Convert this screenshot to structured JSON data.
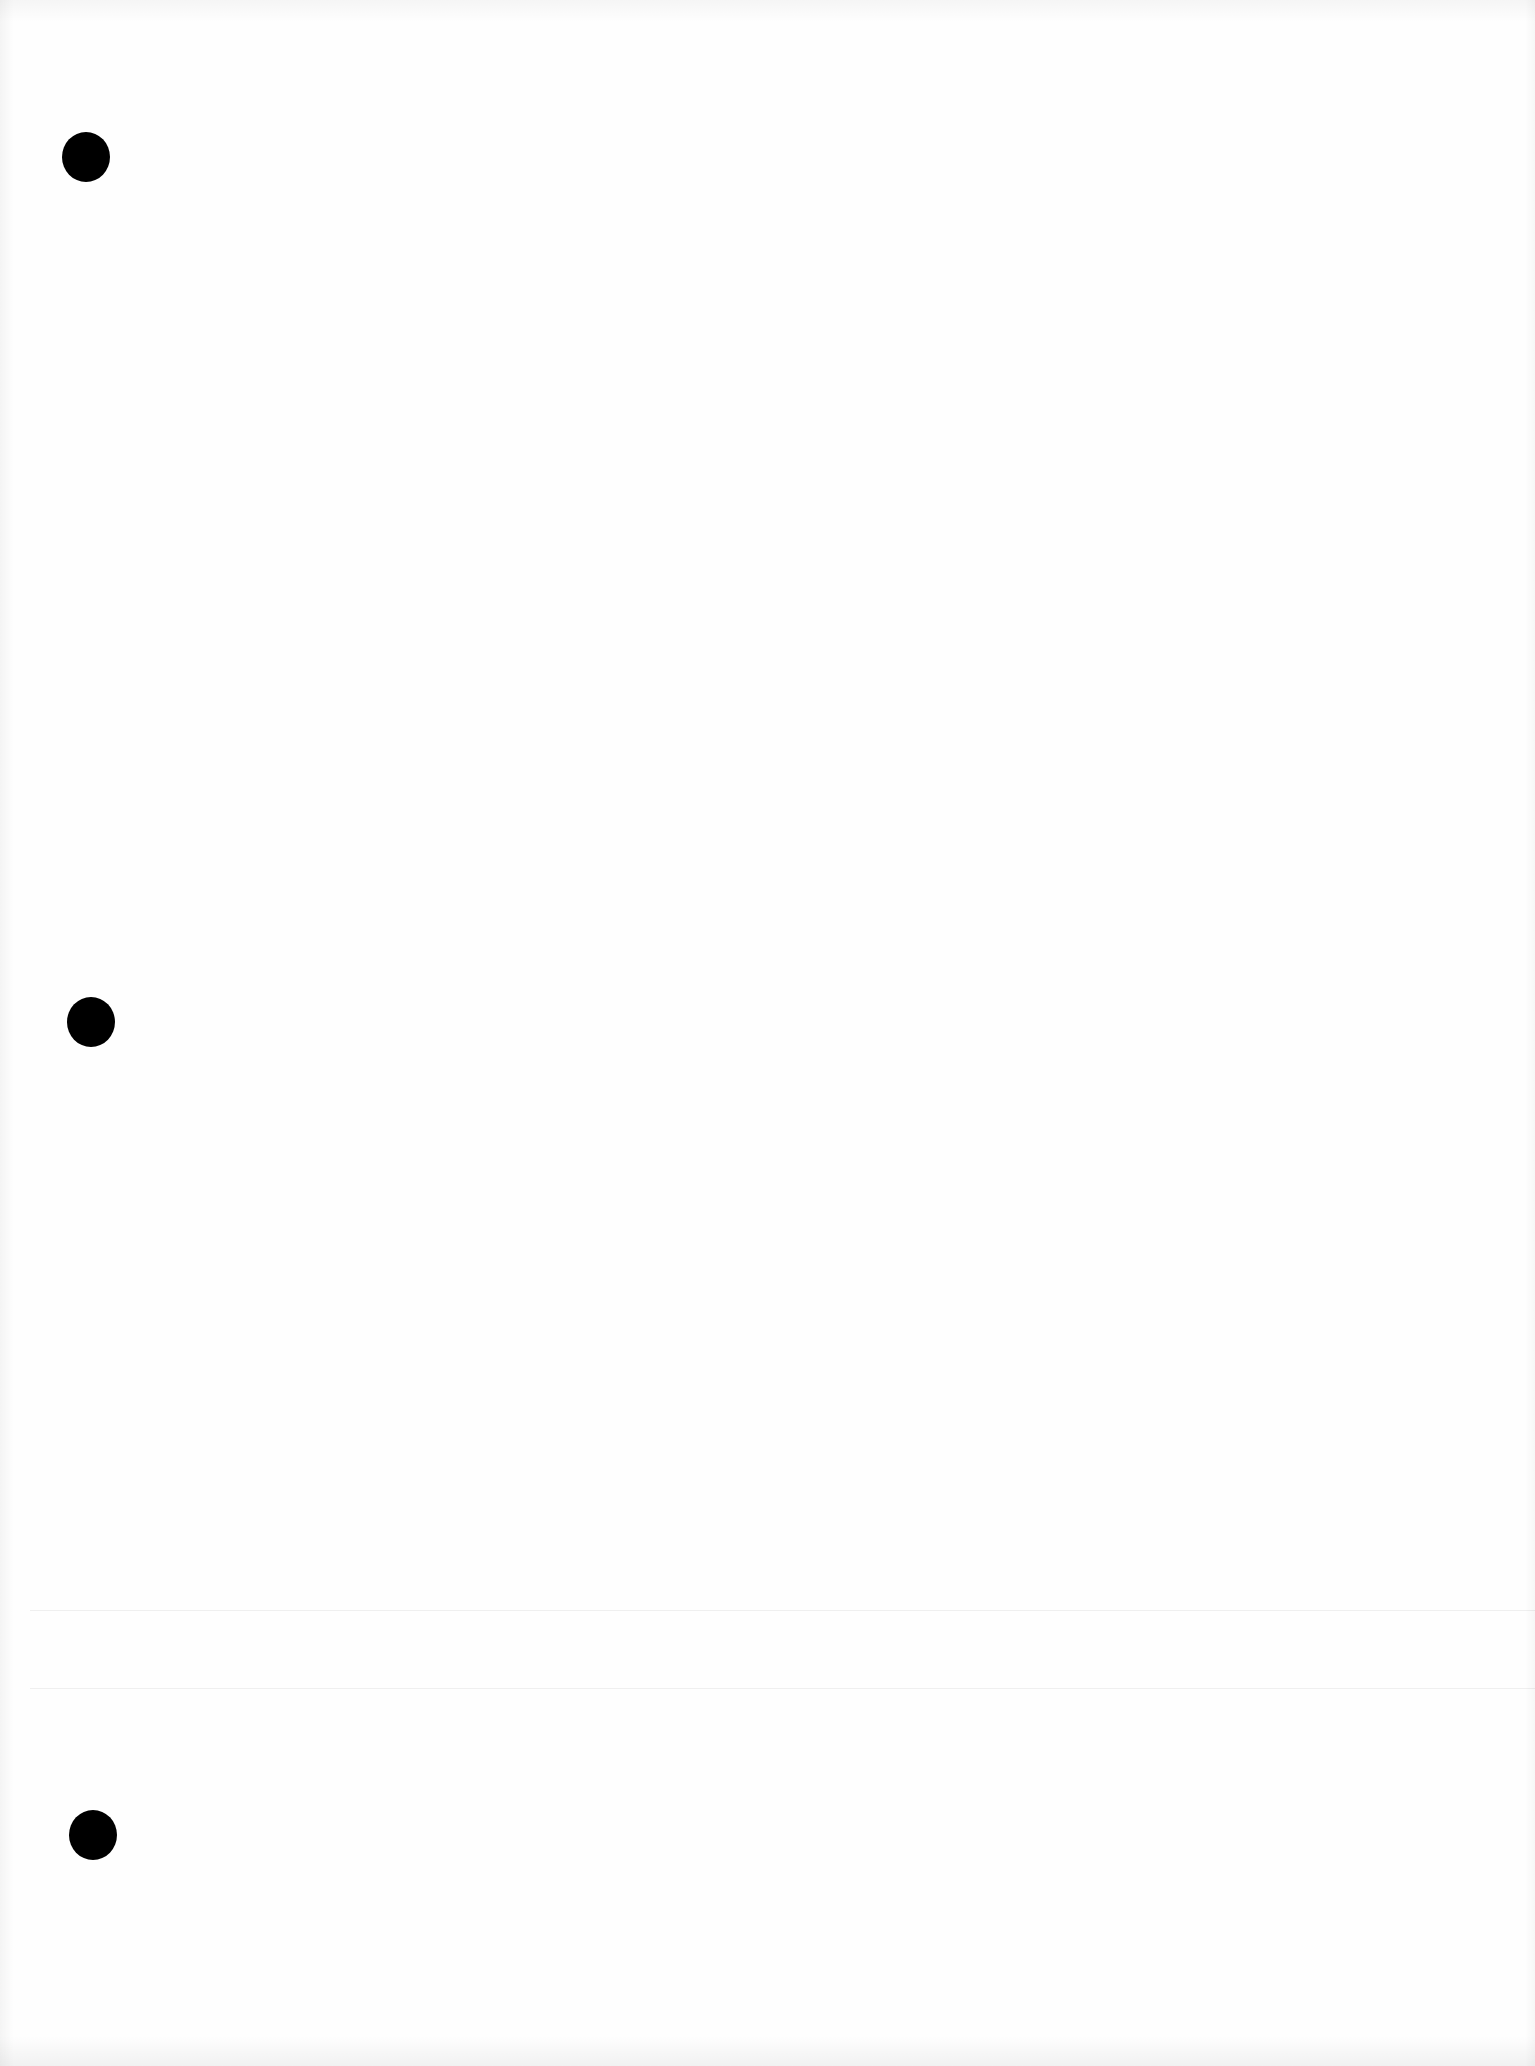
{
  "document": {
    "type": "blank-page",
    "text": "",
    "colors": {
      "paper": "#fefefe",
      "hole": "#000000",
      "fold_line": "rgba(0,0,0,0.06)"
    },
    "punch_holes": [
      {
        "x": 86,
        "y": 157
      },
      {
        "x": 91,
        "y": 1022
      },
      {
        "x": 93,
        "y": 1835
      }
    ],
    "fold_lines": [
      {
        "y": 1610
      },
      {
        "y": 1688
      }
    ]
  }
}
